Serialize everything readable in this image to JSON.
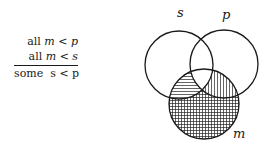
{
  "syllogism": {
    "premises": [
      {
        "quantifier": "all",
        "subject": "m",
        "relation": "<",
        "predicate": "p"
      },
      {
        "quantifier": "all",
        "subject": "m",
        "relation": "<",
        "predicate": "s"
      }
    ],
    "conclusion": {
      "quantifier": "some",
      "subject": "s",
      "relation": "<",
      "predicate": "p"
    }
  },
  "venn": {
    "labels": {
      "s": "s",
      "p": "p",
      "m": "m"
    },
    "shading": {
      "m_only": "crosshatch",
      "m_and_s_not_p": "horizontal",
      "m_and_p_not_s": "vertical",
      "m_and_s_and_p": "none"
    }
  }
}
